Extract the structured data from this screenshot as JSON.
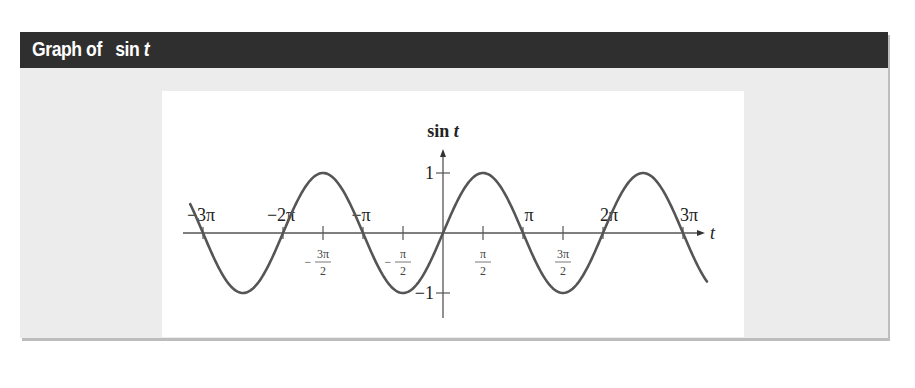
{
  "header": {
    "title_prefix": "Graph of",
    "title_func": "sin",
    "title_var": "t"
  },
  "colors": {
    "titlebar_bg": "#2f2f2f",
    "frame_bg": "#ececec",
    "panel_bg": "#ffffff",
    "curve": "#555555",
    "axis": "#555555"
  },
  "chart_data": {
    "type": "line",
    "title": "sin t",
    "xlabel": "t",
    "ylabel": "sin t",
    "function": "sin(t)",
    "x_range_multiples_of_pi": [
      -3.16,
      3.3
    ],
    "ylim": [
      -1,
      1
    ],
    "y_ticks": [
      {
        "value": 1,
        "label": "1"
      },
      {
        "value": -1,
        "label": "−1"
      }
    ],
    "x_ticks_major": [
      {
        "value_pi": -3,
        "label": "−3π"
      },
      {
        "value_pi": -2,
        "label": "−2π"
      },
      {
        "value_pi": -1,
        "label": "−π"
      },
      {
        "value_pi": 1,
        "label": "π"
      },
      {
        "value_pi": 2,
        "label": "2π"
      },
      {
        "value_pi": 3,
        "label": "3π"
      }
    ],
    "x_ticks_half": [
      {
        "value_pi": -1.5,
        "sign": "−",
        "num": "3π",
        "den": "2"
      },
      {
        "value_pi": -0.5,
        "sign": "−",
        "num": "π",
        "den": "2"
      },
      {
        "value_pi": 0.5,
        "sign": "",
        "num": "π",
        "den": "2"
      },
      {
        "value_pi": 1.5,
        "sign": "",
        "num": "3π",
        "den": "2"
      }
    ],
    "key_points": [
      {
        "t": "-3π",
        "y": 0
      },
      {
        "t": "-5π/2",
        "y": -1
      },
      {
        "t": "-2π",
        "y": 0
      },
      {
        "t": "-3π/2",
        "y": 1
      },
      {
        "t": "-π",
        "y": 0
      },
      {
        "t": "-π/2",
        "y": -1
      },
      {
        "t": "0",
        "y": 0
      },
      {
        "t": "π/2",
        "y": 1
      },
      {
        "t": "π",
        "y": 0
      },
      {
        "t": "3π/2",
        "y": -1
      },
      {
        "t": "2π",
        "y": 0
      },
      {
        "t": "5π/2",
        "y": 1
      },
      {
        "t": "3π",
        "y": 0
      }
    ],
    "grid": false,
    "legend": null
  }
}
